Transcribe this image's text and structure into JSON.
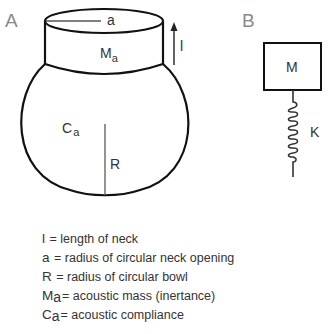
{
  "panels": {
    "a": {
      "label": "A",
      "neck_radius_label": "a",
      "neck_length_label": "l",
      "acoustic_mass_symbol": "M",
      "acoustic_mass_subscript": "a",
      "compliance_symbol": "C",
      "compliance_subscript": "a",
      "bowl_radius_label": "R"
    },
    "b": {
      "label": "B",
      "mass_label": "M",
      "spring_label": "K"
    }
  },
  "legend": [
    {
      "symbol": "l",
      "subscript": "",
      "text": " = length of neck"
    },
    {
      "symbol": "a",
      "subscript": "",
      "text": " = radius of circular neck opening"
    },
    {
      "symbol": "R",
      "subscript": "",
      "text": " = radius of circular bowl"
    },
    {
      "symbol": "M",
      "subscript": "a",
      "text": "= acoustic mass (inertance)"
    },
    {
      "symbol": "C",
      "subscript": "a",
      "text": "= acoustic compliance"
    }
  ]
}
